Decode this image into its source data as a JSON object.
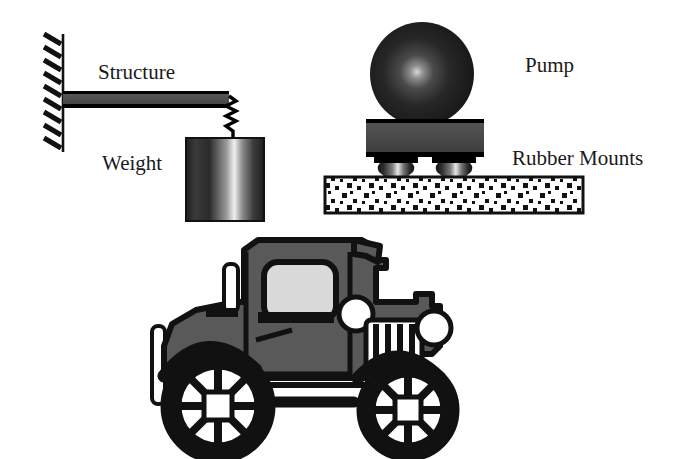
{
  "figure": {
    "background_color": "#ffffff",
    "ink_color": "#1a1a1a"
  },
  "labels": {
    "structure": "Structure",
    "weight": "Weight",
    "pump": "Pump",
    "rubber_mounts": "Rubber Mounts"
  },
  "diagrams": [
    {
      "name": "cantilever-beam-with-hanging-weight",
      "parts": [
        {
          "name": "fixed-wall-support",
          "style": "hatched"
        },
        {
          "name": "structure-beam",
          "fill": "#4d4d4d",
          "stroke": "#000000"
        },
        {
          "name": "zigzag-spring",
          "stroke": "#000000"
        },
        {
          "name": "weight-cylinder",
          "fill": "gradient-gray"
        }
      ]
    },
    {
      "name": "pump-on-rubber-mounts",
      "parts": [
        {
          "name": "pump-sphere",
          "fill": "radial-gradient-dark"
        },
        {
          "name": "pump-base-plate",
          "fill": "#4d4d4d",
          "stroke": "#000000"
        },
        {
          "name": "rubber-mount-left",
          "fill": "gradient-gray"
        },
        {
          "name": "rubber-mount-right",
          "fill": "gradient-gray"
        },
        {
          "name": "concrete-floor-slab",
          "fill": "#ffffff",
          "pattern": "speckled-squares"
        }
      ]
    },
    {
      "name": "vintage-automobile",
      "parts": [
        {
          "name": "car-body",
          "fill": "#595959",
          "stroke": "#000000"
        },
        {
          "name": "car-cab-window",
          "fill": "#d9d9d9"
        },
        {
          "name": "radiator-grille",
          "fill": "#ffffff"
        },
        {
          "name": "headlight",
          "fill": "#ffffff"
        },
        {
          "name": "spare-tire",
          "fill": "#ffffff"
        },
        {
          "name": "rear-wheel",
          "fill": "#ffffff"
        },
        {
          "name": "front-wheel",
          "fill": "#ffffff"
        },
        {
          "name": "exhaust-pipe",
          "fill": "#ffffff"
        }
      ]
    }
  ],
  "colors": {
    "ink": "#1a1a1a",
    "black": "#000000",
    "beam_gray": "#4d4d4d",
    "body_gray": "#595959",
    "window_gray": "#d9d9d9",
    "white": "#ffffff"
  }
}
